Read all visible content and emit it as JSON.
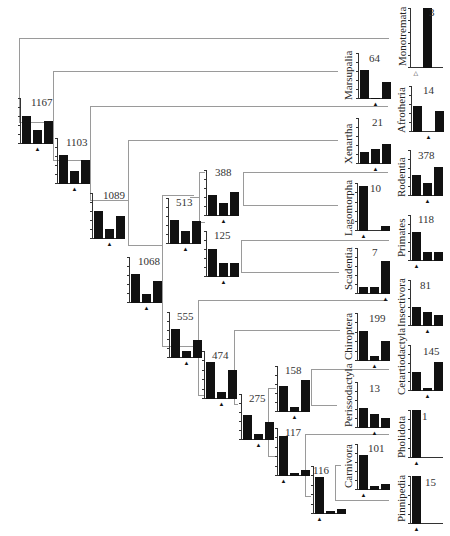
{
  "diagram": {
    "type": "phylogenetic-tree-with-histograms",
    "line_color": "#9a9a9a",
    "bar_color": "#111111",
    "taxa": [
      {
        "name": "Monotremata",
        "count": "3",
        "bars": [
          0,
          1.0,
          0
        ],
        "marker": "hollow-triangle"
      },
      {
        "name": "Marsupalia",
        "count": "64",
        "bars": [
          0.62,
          0.02,
          0.36
        ]
      },
      {
        "name": "Afrotheria",
        "count": "14",
        "bars": [
          0.56,
          0.0,
          0.46
        ]
      },
      {
        "name": "Xenartha",
        "count": "21",
        "bars": [
          0.26,
          0.33,
          0.43
        ]
      },
      {
        "name": "Rodentia",
        "count": "378",
        "bars": [
          0.46,
          0.29,
          0.62
        ]
      },
      {
        "name": "Lagomorpha",
        "count": "10",
        "bars": [
          0.93,
          0.0,
          0.1
        ]
      },
      {
        "name": "Primates",
        "count": "118",
        "bars": [
          0.62,
          0.2,
          0.2
        ]
      },
      {
        "name": "Scadentia",
        "count": "7",
        "bars": [
          0.16,
          0.16,
          0.72
        ]
      },
      {
        "name": "Insectivora",
        "count": "81",
        "bars": [
          0.42,
          0.3,
          0.24
        ]
      },
      {
        "name": "Chiroptera",
        "count": "199",
        "bars": [
          0.62,
          0.1,
          0.42
        ]
      },
      {
        "name": "Cetartiodactyla",
        "count": "145",
        "bars": [
          0.42,
          0.06,
          0.62
        ]
      },
      {
        "name": "Perissodactyla",
        "count": "13",
        "bars": [
          0.44,
          0.3,
          0.22
        ]
      },
      {
        "name": "Pholidota",
        "count": "1",
        "bars": [
          1.0,
          0,
          0
        ]
      },
      {
        "name": "Carnivora",
        "count": "101",
        "bars": [
          0.76,
          0.08,
          0.12
        ]
      },
      {
        "name": "Pinnipedia",
        "count": "15",
        "bars": [
          1.0,
          0,
          0
        ]
      }
    ],
    "internal_nodes": [
      {
        "count": "1167",
        "bars": [
          0.6,
          0.3,
          0.5
        ]
      },
      {
        "count": "1103",
        "bars": [
          0.62,
          0.28,
          0.52
        ]
      },
      {
        "count": "1089",
        "bars": [
          0.6,
          0.22,
          0.5
        ]
      },
      {
        "count": "1068",
        "bars": [
          0.62,
          0.2,
          0.48
        ]
      },
      {
        "count": "513",
        "bars": [
          0.52,
          0.28,
          0.5
        ]
      },
      {
        "count": "388",
        "bars": [
          0.46,
          0.28,
          0.52
        ]
      },
      {
        "count": "125",
        "bars": [
          0.6,
          0.3,
          0.3
        ]
      },
      {
        "count": "555",
        "bars": [
          0.62,
          0.16,
          0.4
        ]
      },
      {
        "count": "474",
        "bars": [
          0.78,
          0.14,
          0.6
        ]
      },
      {
        "count": "275",
        "bars": [
          0.54,
          0.12,
          0.4
        ]
      },
      {
        "count": "158",
        "bars": [
          0.56,
          0.1,
          0.7
        ]
      },
      {
        "count": "117",
        "bars": [
          0.84,
          0.06,
          0.12
        ]
      },
      {
        "count": "116",
        "bars": [
          0.78,
          0.06,
          0.1
        ]
      }
    ]
  }
}
